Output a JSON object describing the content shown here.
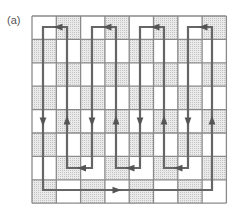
{
  "figure": {
    "label": "(a)",
    "grid": {
      "rows": 8,
      "cols": 8,
      "x0": 32,
      "y0": 16,
      "cell_w": 24.3,
      "cell_h": 23.4,
      "pattern": "checkerboard",
      "shaded_parity": "odd",
      "shaded_color": "#dcdcdc",
      "line_color": "#8a8a8a"
    },
    "path": {
      "color": "#666666",
      "description": "Closed Hamiltonian tour snaking through the grid with directional arrows",
      "verticals_x": [
        43,
        67,
        92,
        116,
        140,
        164,
        188,
        212
      ],
      "top_y": 27,
      "inner_bottom_y": 168,
      "outer_bottom_y": 190
    }
  }
}
